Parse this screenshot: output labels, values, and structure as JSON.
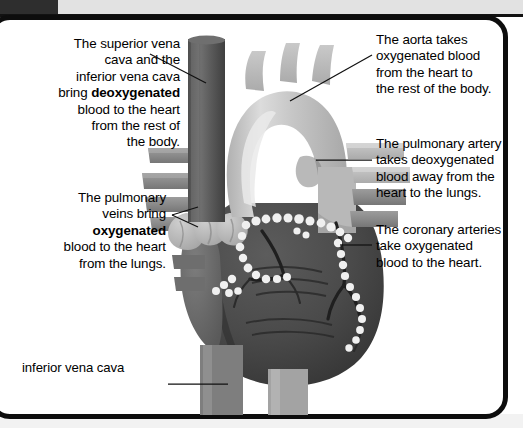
{
  "figure": {
    "colors": {
      "ventricle_dark": "#4a4a4a",
      "atrium_mid": "#6a6a6a",
      "aorta_light": "#c4c4c4",
      "vena_cava": "#5e5e5e",
      "vessel_mid": "#8d8d8d",
      "fat_white": "#f2f2f2",
      "frame_black": "#0d0d0d",
      "page_white": "#ffffff"
    },
    "parts": [
      "superior-vena-cava",
      "inferior-vena-cava",
      "aortic-arch",
      "pulmonary-artery",
      "pulmonary-veins",
      "coronary-arteries",
      "left-ventricle",
      "right-ventricle",
      "right-atrium"
    ]
  },
  "labels": {
    "vena_cava": {
      "line1": "The superior vena",
      "line2": "cava and the",
      "line3": "inferior vena cava",
      "line4_pre": "bring ",
      "line4_bold": "deoxygenated",
      "line5": "blood to the heart",
      "line6": "from the rest of",
      "line7": "the body."
    },
    "pulmonary_veins": {
      "line1": "The pulmonary",
      "line2": "veins bring",
      "line3_bold": "oxygenated",
      "line4": "blood to the heart",
      "line5": "from the lungs."
    },
    "inferior_vena_cava": {
      "text": "inferior vena cava"
    },
    "aorta": {
      "line1": "The aorta takes",
      "line2": "oxygenated blood",
      "line3": "from the heart to",
      "line4": "the rest of the body."
    },
    "pulmonary_artery": {
      "line1": "The pulmonary artery",
      "line2": "takes deoxygenated",
      "line3": "blood away from the",
      "line4": "heart to the lungs."
    },
    "coronary_arteries": {
      "line1": "The coronary arteries",
      "line2": "take oxygenated",
      "line3": "blood to the heart."
    }
  }
}
